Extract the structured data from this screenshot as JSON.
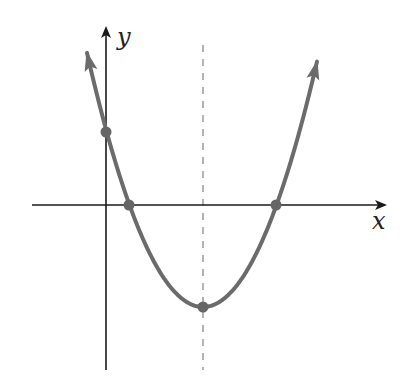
{
  "diagram": {
    "type": "parabola-graph",
    "labels": {
      "x_axis": "x",
      "y_axis": "y"
    },
    "colors": {
      "background": "#ffffff",
      "axes": "#1a1a1a",
      "curve": "#6b6b6b",
      "points": "#666666",
      "symmetry_line": "#8a8a8a"
    },
    "pixel_geometry": {
      "origin": [
        106,
        205
      ],
      "x_axis": {
        "x1": 32,
        "x2": 385,
        "y": 205
      },
      "y_axis": {
        "x": 106,
        "y1": 370,
        "y2": 28
      },
      "symmetry_line": {
        "x": 203,
        "y1": 45,
        "y2": 370
      },
      "vertex": [
        203,
        307
      ],
      "left_root": [
        129,
        205
      ],
      "right_root": [
        276,
        205
      ],
      "y_intercept": [
        106,
        132
      ],
      "curve_left_tip": [
        81,
        28
      ],
      "curve_right_tip": [
        323,
        28
      ]
    },
    "points": [
      {
        "name": "y-intercept",
        "px": [
          106,
          132
        ]
      },
      {
        "name": "left x-intercept",
        "px": [
          129,
          205
        ]
      },
      {
        "name": "right x-intercept",
        "px": [
          276,
          205
        ]
      },
      {
        "name": "vertex",
        "px": [
          203,
          307
        ]
      }
    ]
  }
}
